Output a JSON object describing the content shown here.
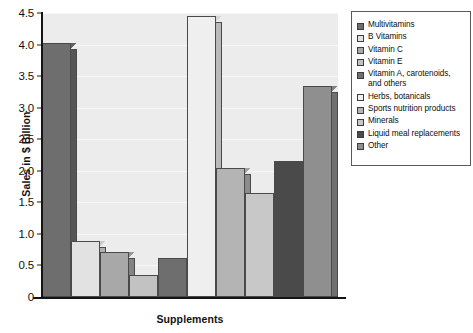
{
  "chart_data": {
    "type": "bar",
    "title": "",
    "xlabel": "Supplements",
    "ylabel": "Sales in $ Billion",
    "categories": [
      "Multivitamins",
      "B Vitamins",
      "Vitamin C",
      "Vitamin E",
      "Vitamin A, carotenoids, and others",
      "Herbs, botanicals",
      "Sports nutrition products",
      "Minerals",
      "Liquid meal replacements",
      "Other"
    ],
    "values": [
      4.02,
      0.88,
      0.72,
      0.35,
      0.62,
      4.45,
      2.05,
      1.65,
      2.15,
      3.35
    ],
    "bar_colors": [
      "#6e6e6e",
      "#e2e2e2",
      "#a8a8a8",
      "#c2c2c2",
      "#6e6e6e",
      "#efefef",
      "#b4b4b4",
      "#c8c8c8",
      "#4a4a4a",
      "#8f8f8f"
    ],
    "ylim": [
      0,
      4.5
    ],
    "yticks": [
      "0",
      "0.5",
      "1.0",
      "1.5",
      "2.0",
      "2.5",
      "3.0",
      "3.5",
      "4.0",
      "4.5"
    ],
    "ytick_values": [
      0,
      0.5,
      1.0,
      1.5,
      2.0,
      2.5,
      3.0,
      3.5,
      4.0,
      4.5
    ],
    "grid": true,
    "legend_position": "right",
    "plot_background": "#ececec"
  },
  "legend": {
    "items": [
      {
        "label": "Multivitamins",
        "color": "#6e6e6e"
      },
      {
        "label": "B Vitamins",
        "color": "#e2e2e2"
      },
      {
        "label": "Vitamin C",
        "color": "#a8a8a8"
      },
      {
        "label": "Vitamin E",
        "color": "#c2c2c2"
      },
      {
        "label": "Vitamin A, carotenoids, and others",
        "color": "#6e6e6e"
      },
      {
        "label": "Herbs, botanicals",
        "color": "#efefef"
      },
      {
        "label": "Sports nutrition products",
        "color": "#b4b4b4"
      },
      {
        "label": "Minerals",
        "color": "#c8c8c8"
      },
      {
        "label": "Liquid meal replacements",
        "color": "#4a4a4a"
      },
      {
        "label": "Other",
        "color": "#8f8f8f"
      }
    ]
  }
}
